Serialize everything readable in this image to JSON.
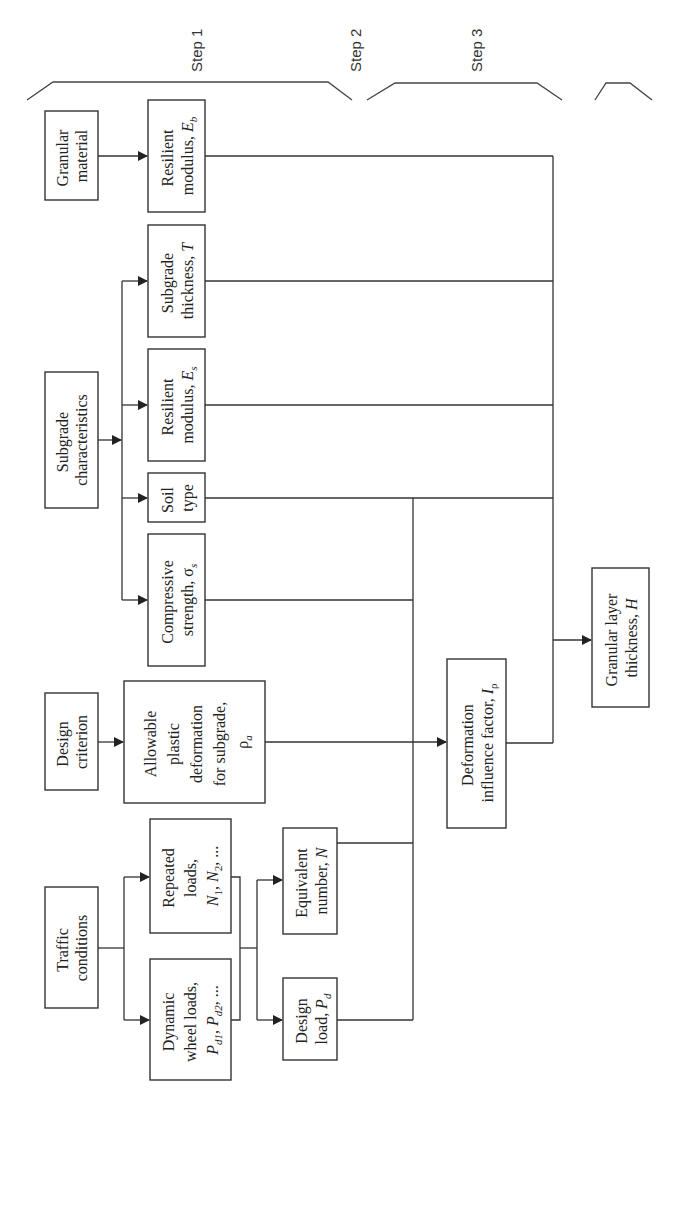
{
  "steps": [
    {
      "label": "Step 1"
    },
    {
      "label": "Step 2"
    },
    {
      "label": "Step 3"
    }
  ],
  "nodes": {
    "granular_material": {
      "lines": [
        "Granular",
        "material"
      ]
    },
    "resilient_modulus_eb": {
      "lines": [
        "Resilient",
        "modulus, E"
      ],
      "sub": "b"
    },
    "subgrade_characteristics": {
      "lines": [
        "Subgrade",
        "characteristics"
      ]
    },
    "subgrade_thickness": {
      "lines": [
        "Subgrade",
        "thickness, T"
      ]
    },
    "resilient_modulus_es": {
      "lines": [
        "Resilient",
        "modulus, E"
      ],
      "sub": "s"
    },
    "soil_type": {
      "lines": [
        "Soil",
        "type"
      ]
    },
    "compressive_strength": {
      "lines": [
        "Compressive",
        "strength, σ"
      ],
      "sub": "s"
    },
    "design_criterion": {
      "lines": [
        "Design",
        "criterion"
      ]
    },
    "allowable_deformation": {
      "lines": [
        "Allowable",
        "plastic",
        "deformation",
        "for subgrade,",
        "ρ"
      ],
      "sub": "a"
    },
    "traffic_conditions": {
      "lines": [
        "Traffic",
        "conditions"
      ]
    },
    "repeated_loads": {
      "lines": [
        "Repeated",
        "loads,",
        "N1, N2, ..."
      ]
    },
    "dynamic_wheel_loads": {
      "lines": [
        "Dynamic",
        "wheel loads,",
        "Pd1, Pd2, ..."
      ]
    },
    "equivalent_number": {
      "lines": [
        "Equivalent",
        "number, N"
      ]
    },
    "design_load": {
      "lines": [
        "Design",
        "load, P"
      ],
      "sub": "d"
    },
    "deformation_influence_factor": {
      "lines": [
        "Deformation",
        "influence factor, I"
      ],
      "sub": "ρ"
    },
    "granular_layer_thickness": {
      "lines": [
        "Granular layer",
        "thickness, H"
      ]
    }
  }
}
